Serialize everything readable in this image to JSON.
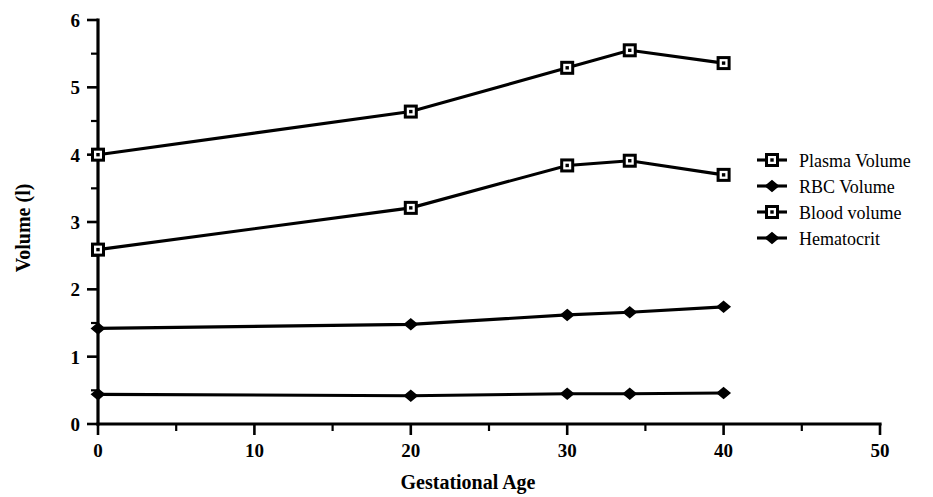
{
  "chart_data": {
    "type": "line",
    "title": "",
    "xlabel": "Gestational Age",
    "ylabel": "Volume (l)",
    "xlim": [
      0,
      50
    ],
    "ylim": [
      0,
      6
    ],
    "x_ticks": [
      0,
      10,
      20,
      30,
      40,
      50
    ],
    "x_tick_labels": [
      "0",
      "10",
      "20",
      "30",
      "40",
      "50"
    ],
    "x_minor_ticks": [
      5,
      15,
      25,
      35,
      45
    ],
    "y_ticks": [
      0,
      1,
      2,
      3,
      4,
      5,
      6
    ],
    "y_tick_labels": [
      "0",
      "1",
      "2",
      "3",
      "4",
      "5",
      "6"
    ],
    "y_minor_ticks": [
      0.5,
      1.5,
      2.5,
      3.5,
      4.5,
      5.5
    ],
    "grid": false,
    "legend_position": "right",
    "x": [
      0,
      20,
      30,
      34,
      40
    ],
    "series": [
      {
        "name": "Blood volume",
        "marker": "open-square",
        "values": [
          4.0,
          4.64,
          5.29,
          5.55,
          5.36
        ]
      },
      {
        "name": "Plasma Volume",
        "marker": "open-square",
        "values": [
          2.59,
          3.21,
          3.84,
          3.91,
          3.7
        ]
      },
      {
        "name": "RBC Volume",
        "marker": "filled-diamond",
        "values": [
          1.42,
          1.48,
          1.62,
          1.66,
          1.74
        ]
      },
      {
        "name": "Hematocrit",
        "marker": "filled-diamond",
        "values": [
          0.44,
          0.42,
          0.45,
          0.45,
          0.46
        ]
      }
    ]
  },
  "legend": {
    "entries": [
      {
        "label": "Plasma Volume",
        "marker": "open-square"
      },
      {
        "label": "RBC Volume",
        "marker": "filled-diamond"
      },
      {
        "label": "Blood volume",
        "marker": "open-square"
      },
      {
        "label": "Hematocrit",
        "marker": "filled-diamond"
      }
    ]
  },
  "axes": {
    "x_title": "Gestational Age",
    "y_title": "Volume (l)"
  },
  "colors": {
    "ink": "#000000",
    "background": "#ffffff"
  }
}
